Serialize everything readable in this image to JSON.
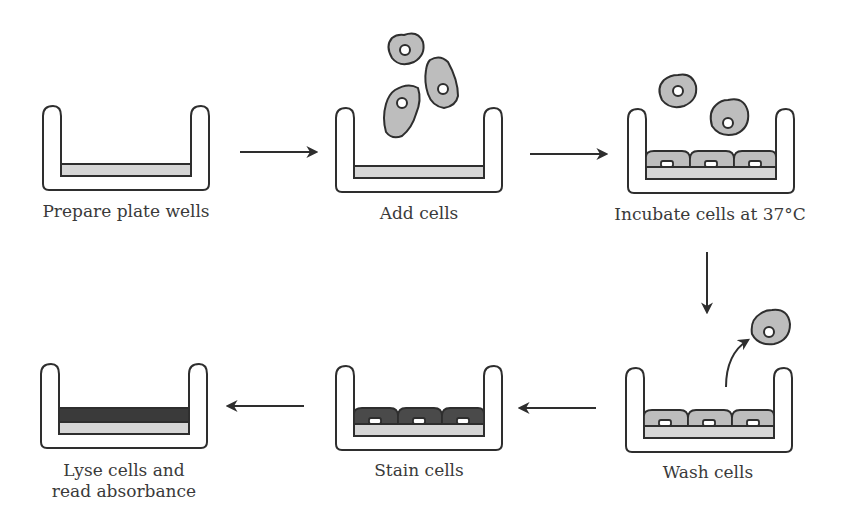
{
  "colors": {
    "outline": "#2e2e2e",
    "plate_fill": "#ffffff",
    "coating": "#d6d6d6",
    "cell": "#bdbdbd",
    "stained_cell": "#4a4a4a",
    "dye_layer": "#3a3a3a",
    "text": "#3a3a3a"
  },
  "steps": [
    {
      "id": 1,
      "label": "Prepare plate wells"
    },
    {
      "id": 2,
      "label": "Add cells"
    },
    {
      "id": 3,
      "label": "Incubate cells at 37°C"
    },
    {
      "id": 4,
      "label": "Wash cells"
    },
    {
      "id": 5,
      "label": "Stain cells"
    },
    {
      "id": 6,
      "label_line1": "Lyse cells and",
      "label_line2": "read absorbance"
    }
  ],
  "arrows": [
    {
      "from": 1,
      "to": 2,
      "direction": "right"
    },
    {
      "from": 2,
      "to": 3,
      "direction": "right"
    },
    {
      "from": 3,
      "to": 4,
      "direction": "down"
    },
    {
      "from": 4,
      "to": 5,
      "direction": "left"
    },
    {
      "from": 5,
      "to": 6,
      "direction": "left"
    }
  ]
}
